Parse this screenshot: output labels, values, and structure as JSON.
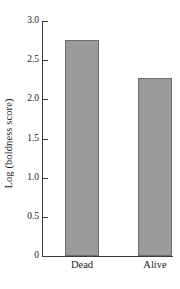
{
  "chart_data": {
    "type": "bar",
    "title": "",
    "subtitle": "",
    "xlabel": "",
    "ylabel": "Log (boldness score)",
    "categories": [
      "Dead",
      "Alive"
    ],
    "values": [
      2.76,
      2.27
    ],
    "series": [
      {
        "name": "Log (boldness score)",
        "values": [
          2.76,
          2.27
        ]
      }
    ],
    "ylim": [
      0,
      3.0
    ],
    "ytick_labels": [
      "0",
      "0.5",
      "1.0",
      "1.5",
      "2.0",
      "2.5",
      "3.0"
    ],
    "ytick_values": [
      0,
      0.5,
      1.0,
      1.5,
      2.0,
      2.5,
      3.0
    ],
    "grid": false,
    "legend": false,
    "legend_position": "none",
    "annotations": [],
    "colors": {
      "bar_fill": "#9b9b9b",
      "bar_border": "#6b6b6b",
      "axis": "#3b3b3b",
      "text": "#1a1a1a",
      "background": "#ffffff"
    }
  }
}
